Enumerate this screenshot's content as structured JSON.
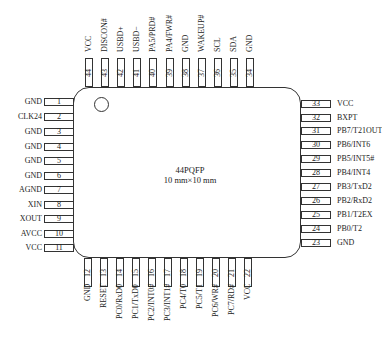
{
  "package": {
    "name": "44PQFP",
    "size": "10 mm×10 mm"
  },
  "pins": {
    "left": [
      {
        "num": "1",
        "name": "GND"
      },
      {
        "num": "2",
        "name": "CLK24"
      },
      {
        "num": "3",
        "name": "GND"
      },
      {
        "num": "4",
        "name": "GND"
      },
      {
        "num": "5",
        "name": "GND"
      },
      {
        "num": "6",
        "name": "GND"
      },
      {
        "num": "7",
        "name": "AGND"
      },
      {
        "num": "8",
        "name": "XIN"
      },
      {
        "num": "9",
        "name": "XOUT"
      },
      {
        "num": "10",
        "name": "AVCC"
      },
      {
        "num": "11",
        "name": "VCC"
      }
    ],
    "bottom": [
      {
        "num": "12",
        "name": "GND"
      },
      {
        "num": "13",
        "name": "RESET"
      },
      {
        "num": "14",
        "name": "PC0/RxD0"
      },
      {
        "num": "15",
        "name": "PC1/TxD0"
      },
      {
        "num": "16",
        "name": "PC2/INT0#"
      },
      {
        "num": "17",
        "name": "PC3/INT1#"
      },
      {
        "num": "18",
        "name": "PC4/T0"
      },
      {
        "num": "19",
        "name": "PC5/T1"
      },
      {
        "num": "20",
        "name": "PC6/WR#"
      },
      {
        "num": "21",
        "name": "PC7/RD#"
      },
      {
        "num": "22",
        "name": "VCC"
      }
    ],
    "right": [
      {
        "num": "23",
        "name": "GND"
      },
      {
        "num": "24",
        "name": "PB0/T2"
      },
      {
        "num": "25",
        "name": "PB1/T2EX"
      },
      {
        "num": "26",
        "name": "PB2/RxD2"
      },
      {
        "num": "27",
        "name": "PB3/TxD2"
      },
      {
        "num": "28",
        "name": "PB4/INT4"
      },
      {
        "num": "29",
        "name": "PB5/INT5#"
      },
      {
        "num": "30",
        "name": "PB6/INT6"
      },
      {
        "num": "31",
        "name": "PB7/T21OUT"
      },
      {
        "num": "32",
        "name": "BXPT"
      },
      {
        "num": "33",
        "name": "VCC"
      }
    ],
    "top": [
      {
        "num": "34",
        "name": "GND"
      },
      {
        "num": "35",
        "name": "SDA"
      },
      {
        "num": "36",
        "name": "SCL"
      },
      {
        "num": "37",
        "name": "WAKEUP#"
      },
      {
        "num": "38",
        "name": "GND"
      },
      {
        "num": "39",
        "name": "PA4/FWR#"
      },
      {
        "num": "40",
        "name": "PA5/PRD#"
      },
      {
        "num": "41",
        "name": "USBD−"
      },
      {
        "num": "42",
        "name": "USBD+"
      },
      {
        "num": "43",
        "name": "DISCON#"
      },
      {
        "num": "44",
        "name": "VCC"
      }
    ]
  }
}
